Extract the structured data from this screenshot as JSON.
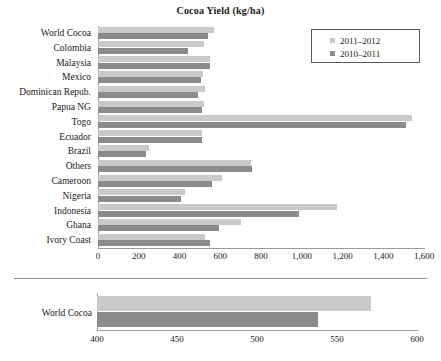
{
  "chart_data": [
    {
      "type": "bar",
      "id": "main",
      "title": "Cocoa Yield (kg/ha)",
      "orientation": "horizontal",
      "xlabel": "",
      "ylabel": "",
      "xlim": [
        0,
        1600
      ],
      "xticks": [
        0,
        200,
        400,
        600,
        800,
        1000,
        1200,
        1400,
        1600
      ],
      "xtick_labels": [
        "0",
        "200",
        "400",
        "600",
        "800",
        "1,000",
        "1,200",
        "1,400",
        "1,600"
      ],
      "grid": false,
      "legend_position": "top-right",
      "categories": [
        "World Cocoa",
        "Colombia",
        "Malaysia",
        "Mexico",
        "Dominican Repub.",
        "Papua NG",
        "Togo",
        "Ecuador",
        "Brazil",
        "Others",
        "Cameroon",
        "Nigeria",
        "Indonesia",
        "Ghana",
        "Ivory Coast"
      ],
      "series": [
        {
          "name": "2011-2012",
          "color": "#c9c9c9",
          "values": [
            571,
            520,
            550,
            515,
            525,
            520,
            1540,
            510,
            250,
            750,
            610,
            425,
            1175,
            700,
            525
          ]
        },
        {
          "name": "2010-2011",
          "color": "#8b8b8b",
          "values": [
            538,
            440,
            550,
            505,
            490,
            510,
            1510,
            510,
            235,
            755,
            560,
            405,
            985,
            595,
            550
          ]
        }
      ]
    },
    {
      "type": "bar",
      "id": "detail",
      "title": "",
      "orientation": "horizontal",
      "xlabel": "",
      "ylabel": "",
      "xlim": [
        400,
        600
      ],
      "xticks": [
        400,
        450,
        500,
        550,
        600
      ],
      "xtick_labels": [
        "400",
        "450",
        "500",
        "550",
        "600"
      ],
      "grid": false,
      "categories": [
        "World Cocoa"
      ],
      "series": [
        {
          "name": "2011-2012",
          "color": "#c9c9c9",
          "values": [
            571
          ]
        },
        {
          "name": "2010-2011",
          "color": "#8b8b8b",
          "values": [
            538
          ]
        }
      ]
    }
  ],
  "header": {
    "title": "Cocoa Yield (kg/ha)"
  },
  "legend": {
    "items": [
      {
        "label": "2011–2012",
        "color": "#c9c9c9"
      },
      {
        "label": "2010–2011",
        "color": "#8b8b8b"
      }
    ]
  },
  "bottom_panel": {
    "category_label": "World Cocoa"
  },
  "colors": {
    "series_light": "#c9c9c9",
    "series_dark": "#8b8b8b",
    "axis": "#9a9a9a",
    "text": "#1a1a1a",
    "background": "#ffffff"
  }
}
